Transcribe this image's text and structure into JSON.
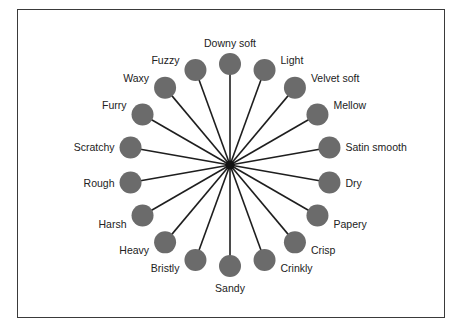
{
  "diagram": {
    "type": "radial-wheel",
    "hub": "center",
    "labels": [
      "Downy soft",
      "Light",
      "Velvet soft",
      "Mellow",
      "Satin smooth",
      "Dry",
      "Papery",
      "Crisp",
      "Crinkly",
      "Sandy",
      "Bristly",
      "Heavy",
      "Harsh",
      "Rough",
      "Scratchy",
      "Furry",
      "Waxy",
      "Fuzzy"
    ],
    "colors": {
      "node": "#6b6b6b",
      "spoke": "#1e1e1e",
      "text": "#222222",
      "frame": "#3a3a3a"
    }
  }
}
